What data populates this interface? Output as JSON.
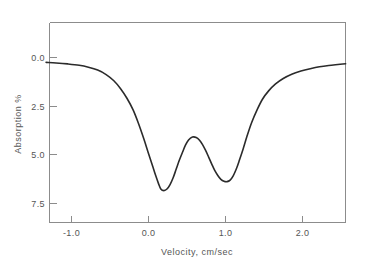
{
  "chart_data": {
    "type": "line",
    "title": "",
    "subtitle": "",
    "xlabel": "Velocity, cm/sec",
    "ylabel": "Absorption %",
    "xlim": [
      -1.33,
      2.56
    ],
    "ylim": [
      -1.79,
      8.46
    ],
    "y_inverted": true,
    "grid": false,
    "legend": null,
    "xticks": [
      -1.0,
      0.0,
      1.0,
      2.0
    ],
    "xticklabels": [
      "-1.0",
      "0.0",
      "1.0",
      "2.0"
    ],
    "yticks": [
      0.0,
      2.5,
      5.0,
      7.5
    ],
    "yticklabels": [
      "0.0",
      "2.5",
      "5.0",
      "7.5"
    ],
    "series": [
      {
        "name": "absorption",
        "color": "#2b2b2b",
        "x": [
          -1.33,
          -1.2,
          -1.05,
          -0.9,
          -0.78,
          -0.66,
          -0.55,
          -0.45,
          -0.36,
          -0.28,
          -0.2,
          -0.13,
          -0.06,
          0.0,
          0.05,
          0.09,
          0.13,
          0.16,
          0.2,
          0.24,
          0.28,
          0.32,
          0.36,
          0.4,
          0.44,
          0.48,
          0.52,
          0.57,
          0.62,
          0.66,
          0.7,
          0.74,
          0.78,
          0.82,
          0.86,
          0.9,
          0.94,
          0.98,
          1.02,
          1.06,
          1.1,
          1.14,
          1.18,
          1.23,
          1.28,
          1.34,
          1.41,
          1.48,
          1.56,
          1.65,
          1.75,
          1.86,
          1.98,
          2.1,
          2.22,
          2.34,
          2.46,
          2.56
        ],
        "y": [
          0.25,
          0.28,
          0.33,
          0.4,
          0.5,
          0.65,
          0.88,
          1.2,
          1.62,
          2.1,
          2.7,
          3.4,
          4.2,
          4.95,
          5.55,
          6.05,
          6.5,
          6.78,
          6.86,
          6.78,
          6.55,
          6.2,
          5.75,
          5.3,
          4.9,
          4.52,
          4.25,
          4.1,
          4.12,
          4.25,
          4.48,
          4.78,
          5.12,
          5.48,
          5.82,
          6.08,
          6.28,
          6.38,
          6.4,
          6.32,
          6.1,
          5.75,
          5.3,
          4.7,
          4.05,
          3.35,
          2.7,
          2.15,
          1.72,
          1.36,
          1.08,
          0.86,
          0.7,
          0.58,
          0.48,
          0.41,
          0.36,
          0.32
        ]
      }
    ]
  },
  "axes": {
    "x_title": "Velocity, cm/sec",
    "y_title": "Absorption %",
    "x_tick_labels": [
      "-1.0",
      "0.0",
      "1.0",
      "2.0"
    ],
    "y_tick_labels": [
      "0.0",
      "2.5",
      "5.0",
      "7.5"
    ]
  },
  "style": {
    "curve_color": "#2b2b2b",
    "axis_color": "#8c8c8c",
    "text_color": "#555555",
    "background": "#ffffff"
  }
}
